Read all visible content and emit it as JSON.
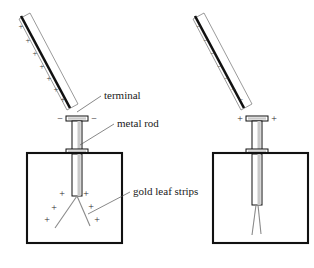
{
  "labels": {
    "terminal": "terminal",
    "metal_rod": "metal rod",
    "gold_leaf_strips": "gold leaf strips"
  },
  "colors": {
    "ink": "#111111",
    "leaf": "#8a8a8a",
    "rod_shade": "#c9c9c9",
    "leader": "#555555"
  },
  "signs": {
    "plus": "+",
    "minus": "−"
  },
  "left_setup": {
    "rod_charge": "+",
    "rod_charge_count": 7,
    "rod_charge_marks": [
      "+",
      "+",
      "+",
      "+",
      "+",
      "+",
      "+"
    ],
    "terminal_charges": [
      "−",
      "−"
    ],
    "leaf_charges": [
      "+",
      "+",
      "+",
      "+",
      "+",
      "+"
    ],
    "leaves_state": "splayed apart"
  },
  "right_setup": {
    "rod_charge": "−",
    "rod_charge_count": 7,
    "rod_charge_marks": [
      "−",
      "−",
      "−",
      "−",
      "−",
      "−",
      "−"
    ],
    "terminal_charges": [
      "+",
      "+"
    ],
    "leaf_charges": [],
    "leaves_state": "nearly closed"
  }
}
